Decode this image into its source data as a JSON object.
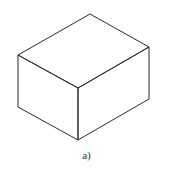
{
  "figure": {
    "caption": "a)",
    "stroke_color": "#2a2a2a",
    "vertices": {
      "top_back": [
        90,
        14
      ],
      "top_left": [
        18,
        55
      ],
      "top_right": [
        149,
        47
      ],
      "top_front": [
        78,
        88
      ],
      "bottom_left": [
        18,
        107
      ],
      "bottom_front": [
        78,
        140
      ],
      "bottom_right": [
        149,
        99
      ]
    }
  }
}
